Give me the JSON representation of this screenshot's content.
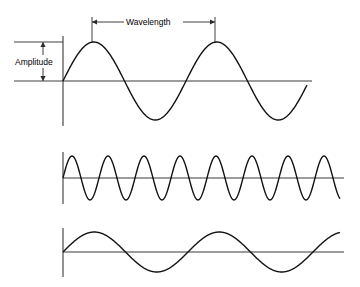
{
  "figure": {
    "title": "",
    "background_color": "#ffffff",
    "stroke_color": "#111111",
    "width": 360,
    "height": 287
  },
  "annotations": {
    "amplitude_label": "Amplitude",
    "wavelength_label": "Wavelength"
  },
  "chart_data": {
    "type": "line",
    "title": "",
    "xlabel": "",
    "ylabel": "",
    "grid": false,
    "legend_position": "none",
    "annotations": [
      {
        "name": "amplitude",
        "text": "Amplitude",
        "kind": "double-headed-vertical-arrow",
        "measures": "distance from baseline to crest of wave 1",
        "x": 43,
        "y_top": 42,
        "y_bottom": 81
      },
      {
        "name": "wavelength",
        "text": "Wavelength",
        "kind": "double-headed-horizontal-arrow",
        "measures": "distance between successive crests of wave 1",
        "y": 22,
        "x_left": 92,
        "x_right": 215
      }
    ],
    "series": [
      {
        "name": "wave-1-reference",
        "description": "Reference sine wave: medium wavelength, large amplitude",
        "amplitude": 39,
        "wavelength": 123,
        "cycles": 2.4,
        "baseline_y": 81,
        "x_start": 63,
        "x_end": 307,
        "phase": "sine starting at zero rising"
      },
      {
        "name": "wave-2-short-wavelength",
        "description": "Short wavelength, small amplitude, high frequency",
        "amplitude": 22,
        "wavelength": 36,
        "cycles": 7.7,
        "baseline_y": 178,
        "x_start": 63,
        "x_end": 340,
        "phase": "sine starting at zero rising"
      },
      {
        "name": "wave-3-long-wavelength",
        "description": "Long wavelength, small amplitude, low frequency",
        "amplitude": 20,
        "wavelength": 125,
        "cycles": 2.2,
        "baseline_y": 252,
        "x_start": 63,
        "x_end": 340,
        "phase": "sine starting at zero rising"
      }
    ]
  }
}
